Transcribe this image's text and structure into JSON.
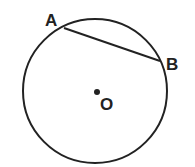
{
  "diagram": {
    "circle": {
      "cx": 95,
      "cy": 91,
      "r": 72
    },
    "center": {
      "label": "O",
      "x": 97,
      "y": 92
    },
    "points": [
      {
        "label": "A",
        "x": 64,
        "y": 28
      },
      {
        "label": "B",
        "x": 160,
        "y": 61
      }
    ],
    "segments": [
      [
        "A",
        "B"
      ]
    ],
    "stroke_color": "#222222"
  }
}
